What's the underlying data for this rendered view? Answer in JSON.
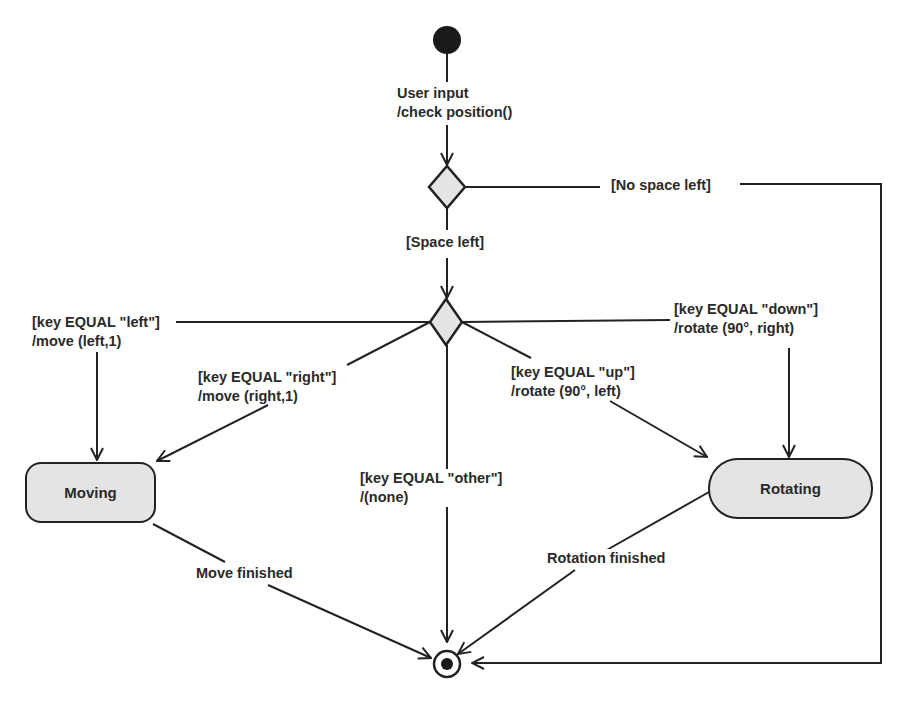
{
  "diagram": {
    "type": "UML state machine",
    "initial_transition": {
      "event": "User input",
      "action": "/check position()"
    },
    "decision1": {
      "guards": {
        "no_space": "[No space left]",
        "space": "[Space left]"
      }
    },
    "decision2": {
      "transitions": [
        {
          "guard": "[key EQUAL \"left\"]",
          "action": "/move (left,1)",
          "target": "Moving"
        },
        {
          "guard": "[key EQUAL \"right\"]",
          "action": "/move (right,1)",
          "target": "Moving"
        },
        {
          "guard": "[key EQUAL \"other\"]",
          "action": "/(none)",
          "target": "final"
        },
        {
          "guard": "[key EQUAL \"up\"]",
          "action": "/rotate (90°, left)",
          "target": "Rotating"
        },
        {
          "guard": "[key EQUAL \"down\"]",
          "action": "/rotate (90°, right)",
          "target": "Rotating"
        }
      ]
    },
    "states": {
      "moving": "Moving",
      "rotating": "Rotating"
    },
    "completion": {
      "moving": "Move finished",
      "rotating": "Rotation finished"
    },
    "colors": {
      "line": "#222222",
      "fill": "#e4e4e4",
      "background": "#ffffff"
    }
  }
}
